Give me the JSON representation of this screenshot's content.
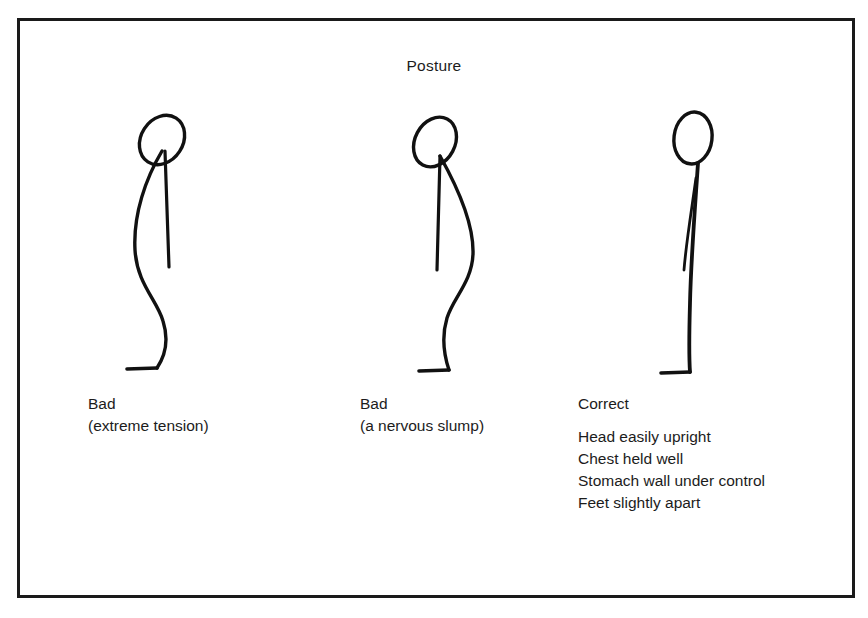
{
  "figure": {
    "title": "Posture",
    "border_color": "#1a1a1a",
    "ink_color": "#111111",
    "background_color": "#ffffff"
  },
  "panels": [
    {
      "id": "panel-bad-tension",
      "heading": "Bad",
      "subheading": "(extreme tension)",
      "pose_name": "extreme-tension-stick-figure",
      "details": []
    },
    {
      "id": "panel-bad-slump",
      "heading": "Bad",
      "subheading": "(a nervous slump)",
      "pose_name": "nervous-slump-stick-figure",
      "details": []
    },
    {
      "id": "panel-correct",
      "heading": "Correct",
      "subheading": "",
      "pose_name": "correct-posture-stick-figure",
      "details": [
        "Head easily upright",
        "Chest held well",
        "Stomach wall under control",
        "Feet slightly apart"
      ]
    }
  ]
}
